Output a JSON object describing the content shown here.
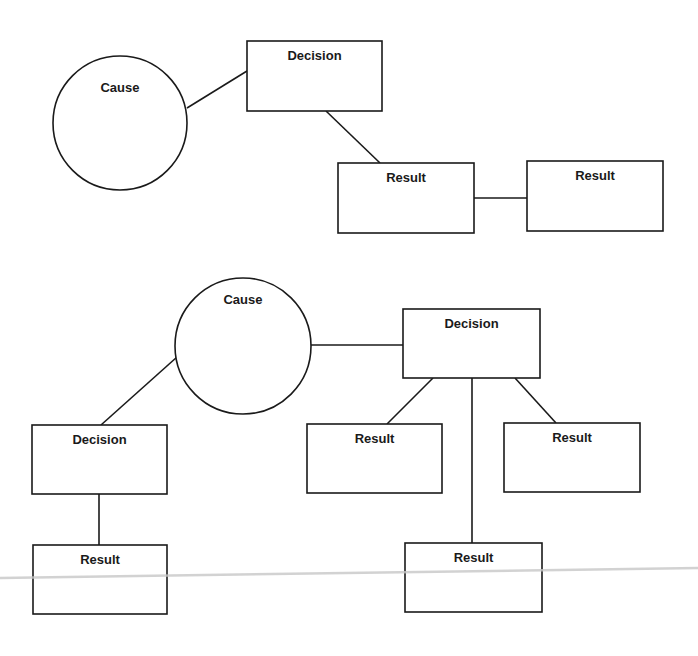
{
  "diagrams": [
    {
      "name": "diagram-1",
      "nodes": [
        {
          "id": "cause1",
          "type": "circle",
          "label": "Cause",
          "cx": 120,
          "cy": 123,
          "r": 67,
          "label_y": 92
        },
        {
          "id": "decision1",
          "type": "box",
          "label": "Decision",
          "x": 247,
          "y": 41,
          "w": 135,
          "h": 70,
          "label_y": 60
        },
        {
          "id": "result1",
          "type": "box",
          "label": "Result",
          "x": 338,
          "y": 163,
          "w": 136,
          "h": 70,
          "label_y": 182
        },
        {
          "id": "result2",
          "type": "box",
          "label": "Result",
          "x": 527,
          "y": 161,
          "w": 136,
          "h": 70,
          "label_y": 180
        }
      ],
      "edges": [
        {
          "from": "cause1",
          "to": "decision1",
          "x1": 187,
          "y1": 108,
          "x2": 247,
          "y2": 71
        },
        {
          "from": "decision1",
          "to": "result1",
          "x1": 326,
          "y1": 111,
          "x2": 380,
          "y2": 163
        },
        {
          "from": "result1",
          "to": "result2",
          "x1": 474,
          "y1": 198,
          "x2": 527,
          "y2": 198
        }
      ]
    },
    {
      "name": "diagram-2",
      "nodes": [
        {
          "id": "cause2",
          "type": "circle",
          "label": "Cause",
          "cx": 243,
          "cy": 346,
          "r": 68,
          "label_y": 304
        },
        {
          "id": "decision2",
          "type": "box",
          "label": "Decision",
          "x": 403,
          "y": 309,
          "w": 137,
          "h": 69,
          "label_y": 328
        },
        {
          "id": "decision3",
          "type": "box",
          "label": "Decision",
          "x": 32,
          "y": 425,
          "w": 135,
          "h": 69,
          "label_y": 444
        },
        {
          "id": "result3",
          "type": "box",
          "label": "Result",
          "x": 307,
          "y": 424,
          "w": 135,
          "h": 69,
          "label_y": 443
        },
        {
          "id": "result4",
          "type": "box",
          "label": "Result",
          "x": 504,
          "y": 423,
          "w": 136,
          "h": 69,
          "label_y": 442
        },
        {
          "id": "result5",
          "type": "box",
          "label": "Result",
          "x": 405,
          "y": 543,
          "w": 137,
          "h": 69,
          "label_y": 562
        },
        {
          "id": "result6",
          "type": "box",
          "label": "Result",
          "x": 33,
          "y": 545,
          "w": 134,
          "h": 69,
          "label_y": 564
        }
      ],
      "edges": [
        {
          "from": "cause2",
          "to": "decision2",
          "x1": 311,
          "y1": 345,
          "x2": 403,
          "y2": 345
        },
        {
          "from": "cause2",
          "to": "decision3",
          "x1": 177,
          "y1": 357,
          "x2": 101,
          "y2": 425
        },
        {
          "from": "decision2",
          "to": "result3",
          "x1": 433,
          "y1": 378,
          "x2": 387,
          "y2": 424
        },
        {
          "from": "decision2",
          "to": "result5",
          "x1": 472,
          "y1": 378,
          "x2": 472,
          "y2": 543
        },
        {
          "from": "decision2",
          "to": "result4",
          "x1": 515,
          "y1": 378,
          "x2": 556,
          "y2": 423
        },
        {
          "from": "decision3",
          "to": "result6",
          "x1": 99,
          "y1": 494,
          "x2": 99,
          "y2": 545
        }
      ]
    }
  ],
  "artifacts": {
    "scan_line": {
      "x1": 0,
      "y1": 578,
      "x2": 698,
      "y2": 568,
      "color": "#c8c8c8"
    }
  },
  "colors": {
    "stroke": "#1a1a1a",
    "background": "#ffffff",
    "text": "#1a1a1a"
  }
}
